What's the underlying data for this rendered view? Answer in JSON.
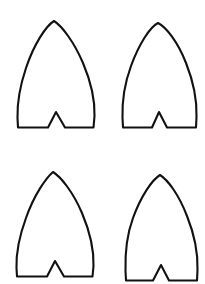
{
  "page": {
    "background_color": "#ffffff",
    "stroke_color": "#111111",
    "stroke_width": 2.1,
    "width": 205,
    "height": 284,
    "shape_count": 4
  },
  "shapes": [
    {
      "id": "shape-top-left",
      "label": "Fin template top left",
      "row": 1,
      "column": 1,
      "tip": {
        "x": 54,
        "y": 21
      },
      "bounds": {
        "left": 17,
        "top": 21,
        "right": 95,
        "bottom": 128
      },
      "notch": {
        "apex_x": 56,
        "apex_y": 112,
        "left_x": 48,
        "right_x": 65,
        "base_y": 128
      },
      "path": "M 54 21 C 46 26, 34 44, 26 68 C 20 86, 17 102, 17.5 118 L 18 127.5 L 48 127.5 L 56 112 L 65 127.5 L 93.5 127.5 L 94.5 116 C 95 100, 91 82, 83 63 C 74 42, 62 26, 54 21 Z"
    },
    {
      "id": "shape-top-right",
      "label": "Fin template top right",
      "row": 1,
      "column": 2,
      "tip": {
        "x": 158,
        "y": 23
      },
      "bounds": {
        "left": 122,
        "top": 23,
        "right": 197,
        "bottom": 128
      },
      "notch": {
        "apex_x": 159,
        "apex_y": 112,
        "left_x": 152,
        "right_x": 167,
        "base_y": 128
      },
      "path": "M 158 23 C 150 27, 139 44, 131 66 C 124 85, 122 101, 122.5 118 L 123 127.5 L 152 127.5 L 159 112 L 167 127.5 L 196 127.5 L 196.5 117 C 197 101, 194 83, 186 63 C 178 42, 166 27, 158 23 Z"
    },
    {
      "id": "shape-bottom-left",
      "label": "Fin template bottom left",
      "row": 2,
      "column": 1,
      "tip": {
        "x": 53,
        "y": 172
      },
      "bounds": {
        "left": 16,
        "top": 172,
        "right": 94,
        "bottom": 277
      },
      "notch": {
        "apex_x": 55,
        "apex_y": 261,
        "left_x": 47,
        "right_x": 64,
        "base_y": 277
      },
      "path": "M 53 172 C 46 178, 34 195, 26 218 C 19 237, 16 253, 16.5 268 L 17 276.5 L 47 276.5 L 55 261 L 64 276.5 L 92.5 276.5 L 93.5 266 C 94 250, 90 232, 82 213 C 73 192, 61 177, 53 172 Z"
    },
    {
      "id": "shape-bottom-right",
      "label": "Fin template bottom right",
      "row": 2,
      "column": 2,
      "tip": {
        "x": 160,
        "y": 175
      },
      "bounds": {
        "left": 125,
        "top": 175,
        "right": 198,
        "bottom": 281
      },
      "notch": {
        "apex_x": 161,
        "apex_y": 265,
        "left_x": 153,
        "right_x": 169,
        "base_y": 281
      },
      "path": "M 160 175 C 152 180, 141 196, 133 218 C 126 237, 125 253, 125.5 271 L 126 280.5 L 153 280.5 L 161 265 L 169 280.5 L 197 280.5 L 197.5 270 C 198 254, 195 236, 187 216 C 179 195, 168 180, 160 175 Z"
    }
  ]
}
